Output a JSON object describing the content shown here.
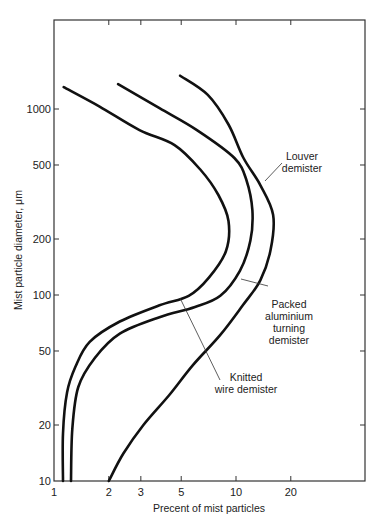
{
  "chart_data": {
    "type": "line",
    "title": "",
    "xlabel": "Precent of mist particles",
    "ylabel": "Mist particle diameter, μm",
    "xscale": "log",
    "yscale": "log",
    "xlim": [
      1,
      45
    ],
    "ylim": [
      10,
      2800
    ],
    "grid": false,
    "legend_position": "inline annotations",
    "x_ticks": [
      1,
      2,
      3,
      5,
      10,
      20
    ],
    "x_tick_labels": [
      "1",
      "2",
      "3",
      "5",
      "10",
      "20"
    ],
    "y_ticks": [
      10,
      20,
      50,
      100,
      200,
      500,
      1000
    ],
    "y_tick_labels": [
      "10",
      "20",
      "50",
      "100",
      "200",
      "500",
      "1000"
    ],
    "series": [
      {
        "name": "Knitted wire demister",
        "points": [
          [
            1.13,
            1310
          ],
          [
            1.78,
            1030
          ],
          [
            2.95,
            770
          ],
          [
            4.6,
            640
          ],
          [
            6.4,
            470
          ],
          [
            8.0,
            345
          ],
          [
            9.1,
            250
          ],
          [
            8.8,
            172
          ],
          [
            7.1,
            124
          ],
          [
            5.5,
            99
          ],
          [
            3.8,
            88
          ],
          [
            2.3,
            72
          ],
          [
            1.57,
            56
          ],
          [
            1.31,
            41
          ],
          [
            1.18,
            30
          ],
          [
            1.12,
            18
          ],
          [
            1.12,
            10
          ]
        ]
      },
      {
        "name": "Packed aluminium turning demister",
        "points": [
          [
            2.25,
            1360
          ],
          [
            3.8,
            1010
          ],
          [
            6.1,
            770
          ],
          [
            9.8,
            545
          ],
          [
            11.4,
            415
          ],
          [
            12.3,
            285
          ],
          [
            12.0,
            196
          ],
          [
            10.5,
            135
          ],
          [
            8.2,
            99
          ],
          [
            5.9,
            86
          ],
          [
            3.8,
            76
          ],
          [
            2.3,
            62
          ],
          [
            1.68,
            46
          ],
          [
            1.36,
            32
          ],
          [
            1.26,
            19
          ],
          [
            1.24,
            10
          ]
        ]
      },
      {
        "name": "Louver demister",
        "points": [
          [
            4.93,
            1510
          ],
          [
            7.0,
            1190
          ],
          [
            9.1,
            825
          ],
          [
            11.0,
            545
          ],
          [
            13.6,
            390
          ],
          [
            16.0,
            270
          ],
          [
            15.5,
            175
          ],
          [
            13.6,
            120
          ],
          [
            10.9,
            88
          ],
          [
            8.2,
            61
          ],
          [
            5.8,
            42
          ],
          [
            4.3,
            29
          ],
          [
            3.1,
            20
          ],
          [
            2.4,
            14
          ],
          [
            2.0,
            10
          ]
        ]
      }
    ],
    "annotations": [
      {
        "text_lines": [
          "Louver",
          "demister"
        ],
        "points_to": "Louver demister"
      },
      {
        "text_lines": [
          "Packed",
          "aluminium",
          "turning",
          "demister"
        ],
        "points_to": "Packed aluminium turning demister"
      },
      {
        "text_lines": [
          "Knitted",
          "wire demister"
        ],
        "points_to": "Knitted wire demister"
      }
    ]
  },
  "labels": {
    "xlabel": "Precent of mist particles",
    "ylabel": "Mist particle diameter, μm",
    "louver_1": "Louver",
    "louver_2": "demister",
    "packed_1": "Packed",
    "packed_2": "aluminium",
    "packed_3": "turning",
    "packed_4": "demister",
    "knitted_1": "Knitted",
    "knitted_2": "wire demister"
  }
}
